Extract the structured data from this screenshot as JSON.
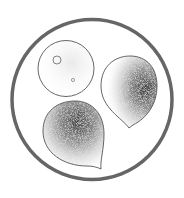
{
  "figure": {
    "type": "stippled scientific illustration",
    "colors": {
      "background": "#ffffff",
      "frame_ring": "#666666",
      "outline": "#555555",
      "stipple_dark": "#333333",
      "stipple_light": "#9a9a9a"
    },
    "frame": {
      "shape": "circle",
      "cx": 92,
      "cy": 99.5,
      "r": 80,
      "stroke_width": 3.5
    },
    "bodies": [
      {
        "name": "round-spore",
        "shape": "circle",
        "cx": 66,
        "cy": 68.5,
        "r": 28,
        "shading": "light",
        "vacuoles": [
          {
            "cx": 57,
            "cy": 60,
            "r": 4
          },
          {
            "cx": 73,
            "cy": 80,
            "r": 1.6
          }
        ]
      },
      {
        "name": "upper-teardrop-spore",
        "shape": "teardrop",
        "tip": [
          129,
          128
        ],
        "shading": "dark-right"
      },
      {
        "name": "lower-teardrop-spore",
        "shape": "teardrop",
        "tip": [
          101,
          169
        ],
        "shading": "dark-upper"
      }
    ]
  }
}
